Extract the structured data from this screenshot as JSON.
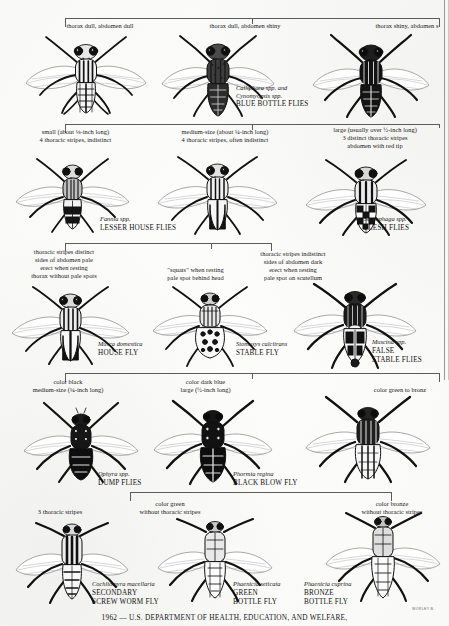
{
  "document": {
    "kind": "identification-chart",
    "footer": "1962 — U.S. DEPARTMENT OF HEALTH, EDUCATION, AND WELFARE,",
    "artist_signature": "WORLEY  B."
  },
  "rows": [
    {
      "id": "row-1-blow-flies",
      "bracket": {
        "x": 65,
        "y": 18,
        "width": 375,
        "ticks": [
          0,
          0.5,
          1
        ]
      },
      "captions": [
        {
          "id": "cap-1-1",
          "text": "thorax dull, abdomen dull",
          "align": "center"
        },
        {
          "id": "cap-1-2",
          "text": "thorax dull, abdomen shiny",
          "align": "center"
        },
        {
          "id": "cap-1-3",
          "text": "thorax shiny, abdomen s",
          "align": "center"
        }
      ],
      "labels": [
        {
          "id": "label-1-2",
          "scientific": "Calliphora spp. and\nCynomyopsis spp.",
          "common": "BLUE BOTTLE FLIES"
        }
      ]
    },
    {
      "id": "row-2-house-flesh",
      "bracket": {
        "x": 65,
        "y": 124,
        "width": 375,
        "ticks": [
          0,
          0.5,
          1
        ]
      },
      "captions": [
        {
          "id": "cap-2-1",
          "text": "small (about ⅛-inch long)\n4 thoracic stripes, indistinct",
          "align": "center"
        },
        {
          "id": "cap-2-2",
          "text": "medium-size (about ¼-inch long)\n4 thoracic stripes, often indistinct",
          "align": "center"
        },
        {
          "id": "cap-2-3",
          "text": "large (usually over ½-inch long)\n3 distinct thoracic stripes\nabdomen with red tip",
          "align": "center"
        }
      ],
      "labels": [
        {
          "id": "label-2-1",
          "scientific": "Fannia spp.",
          "common": "LESSER HOUSE FLIES"
        },
        {
          "id": "label-2-3",
          "scientific": "Sarcophaga spp.",
          "common": "FLESH FLIES"
        }
      ]
    },
    {
      "id": "row-3-muscoid",
      "bracket": {
        "x": 65,
        "y": 243,
        "width": 207,
        "ticks": [
          0,
          0.5,
          1
        ]
      },
      "captions": [
        {
          "id": "cap-3-1",
          "text": "thoracic stripes distinct\nsides of abdomen pale\nerect when resting\nthorax without pale spots",
          "align": "center"
        },
        {
          "id": "cap-3-2",
          "text": "\"squats\" when resting\npale spot behind head",
          "align": "center"
        },
        {
          "id": "cap-3-3",
          "text": "thoracic stripes indistinct\nsides of abdomen dark\nerect when resting\npale spot on scutellum",
          "align": "center"
        }
      ],
      "labels": [
        {
          "id": "label-3-1",
          "scientific": "Musca domestica",
          "common": "HOUSE FLY"
        },
        {
          "id": "label-3-2",
          "scientific": "Stomoxys calcitrans",
          "common": "STABLE FLY"
        },
        {
          "id": "label-3-3",
          "scientific": "Muscina spp.",
          "common": "FALSE\nSTABLE FLIES"
        }
      ]
    },
    {
      "id": "row-4-dump-blowfly",
      "bracket": {
        "x": 65,
        "y": 373,
        "width": 375,
        "ticks": [
          0,
          0.5,
          1
        ]
      },
      "captions": [
        {
          "id": "cap-4-1",
          "text": "color black\nmedium-size (¼-inch long)",
          "align": "center"
        },
        {
          "id": "cap-4-2",
          "text": "color dark blue\nlarge (½-inch long)",
          "align": "center"
        },
        {
          "id": "cap-4-3",
          "text": "color green to bronz",
          "align": "center"
        }
      ],
      "labels": [
        {
          "id": "label-4-1",
          "scientific": "Ophyra spp.",
          "common": "DUMP FLIES"
        },
        {
          "id": "label-4-2",
          "scientific": "Phormia regina",
          "common": "BLACK BLOW FLY"
        }
      ]
    },
    {
      "id": "row-5-bottle-flies",
      "bracket": {
        "x": 130,
        "y": 492,
        "width": 262,
        "ticks": [
          0,
          0.5,
          1
        ]
      },
      "captions": [
        {
          "id": "cap-5-1",
          "text": "3 thoracic stripes",
          "align": "center"
        },
        {
          "id": "cap-5-2",
          "text": "color green\nwithout thoracic stripes",
          "align": "center"
        },
        {
          "id": "cap-5-3",
          "text": "color bronze\nwithout thoracic stripes",
          "align": "center"
        }
      ],
      "labels": [
        {
          "id": "label-5-1",
          "scientific": "Cochliomyra macellaria",
          "common": "SECONDARY\nSCREW WORM FLY"
        },
        {
          "id": "label-5-2",
          "scientific": "Phaenicia seticata",
          "common": "GREEN\nBOTTLE FLY"
        },
        {
          "id": "label-5-3",
          "scientific": "Phaenicia cuprina",
          "common": "BRONZE\nBOTTLE FLY"
        }
      ]
    }
  ],
  "icons": {
    "fly": "fly-illustration-icon",
    "bracket": "key-bracket-icon"
  },
  "colors": {
    "ink": "#17171a",
    "line": "#5c5c58",
    "paper": "#fdfdfb"
  }
}
